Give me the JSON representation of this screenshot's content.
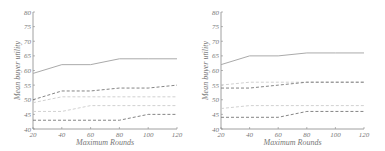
{
  "chart_data": [
    {
      "type": "line",
      "title": "",
      "xlabel": "Maximum Rounds",
      "ylabel": "Mean buyer utility",
      "x": [
        20,
        40,
        60,
        80,
        100,
        120
      ],
      "xticks": [
        "20",
        "40",
        "60",
        "80",
        "100",
        "120"
      ],
      "yticks": [
        "40",
        "45",
        "50",
        "55",
        "60",
        "65",
        "70",
        "75",
        "80"
      ],
      "xlim": [
        20,
        120
      ],
      "ylim": [
        40,
        80
      ],
      "grid": false,
      "legend": null,
      "series": [
        {
          "name": "solid",
          "style": "solid",
          "color": "#aaaaaa",
          "values": [
            59,
            62,
            62,
            64,
            64,
            64
          ]
        },
        {
          "name": "dashed-dark-upper",
          "style": "dashed",
          "color": "#777777",
          "values": [
            50,
            53,
            53,
            54,
            54,
            55
          ]
        },
        {
          "name": "dashed-light-upper",
          "style": "dashed",
          "color": "#cccccc",
          "values": [
            49,
            51,
            51,
            51,
            51,
            51
          ]
        },
        {
          "name": "dashed-light-lower",
          "style": "dashed",
          "color": "#cccccc",
          "values": [
            46,
            46,
            48,
            48,
            48,
            48
          ]
        },
        {
          "name": "dashed-dark-lower",
          "style": "dashed",
          "color": "#777777",
          "values": [
            43,
            43,
            43,
            43,
            45,
            45
          ]
        }
      ]
    },
    {
      "type": "line",
      "title": "",
      "xlabel": "Maximum Rounds",
      "ylabel": "Mean buyer utility",
      "x": [
        20,
        40,
        60,
        80,
        100,
        120
      ],
      "xticks": [
        "20",
        "40",
        "60",
        "80",
        "100",
        "120"
      ],
      "yticks": [
        "40",
        "45",
        "50",
        "55",
        "60",
        "65",
        "70",
        "75",
        "80"
      ],
      "xlim": [
        20,
        120
      ],
      "ylim": [
        40,
        80
      ],
      "grid": false,
      "legend": null,
      "series": [
        {
          "name": "solid",
          "style": "solid",
          "color": "#aaaaaa",
          "values": [
            62,
            65,
            65,
            66,
            66,
            66
          ]
        },
        {
          "name": "dashed-light-upper",
          "style": "dashed",
          "color": "#cccccc",
          "values": [
            55,
            56,
            56,
            56,
            56,
            56
          ]
        },
        {
          "name": "dashed-dark-upper",
          "style": "dashed",
          "color": "#777777",
          "values": [
            54,
            54,
            55,
            56,
            56,
            56
          ]
        },
        {
          "name": "dashed-light-lower",
          "style": "dashed",
          "color": "#cccccc",
          "values": [
            47,
            48,
            48,
            48,
            48,
            48
          ]
        },
        {
          "name": "dashed-dark-lower",
          "style": "dashed",
          "color": "#777777",
          "values": [
            44,
            44,
            44,
            46,
            46,
            46
          ]
        }
      ]
    }
  ]
}
